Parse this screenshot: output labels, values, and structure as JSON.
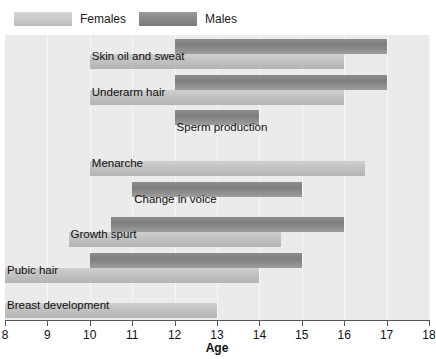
{
  "chart_data": {
    "type": "bar",
    "orientation": "horizontal",
    "title": "",
    "xlabel": "Age",
    "ylabel": "",
    "xlim": [
      8,
      18
    ],
    "xticks": [
      8,
      9,
      10,
      11,
      12,
      13,
      14,
      15,
      16,
      17,
      18
    ],
    "grid": true,
    "legend": {
      "position": "top-left",
      "entries": [
        {
          "name": "Females",
          "color": "#c5c5c5"
        },
        {
          "name": "Males",
          "color": "#858585"
        }
      ]
    },
    "categories": [
      "Skin oil and sweat",
      "Underarm hair",
      "Sperm production",
      "Menarche",
      "Change in voice",
      "Growth spurt",
      "Pubic hair",
      "Breast development"
    ],
    "series": [
      {
        "name": "Males",
        "color": "#858585",
        "ranges": [
          {
            "category": "Skin oil and sweat",
            "start": 12.0,
            "end": 17.0
          },
          {
            "category": "Underarm hair",
            "start": 12.0,
            "end": 17.0
          },
          {
            "category": "Sperm production",
            "start": 12.0,
            "end": 14.0
          },
          {
            "category": "Menarche",
            "start": null,
            "end": null
          },
          {
            "category": "Change in voice",
            "start": 11.0,
            "end": 15.0
          },
          {
            "category": "Growth spurt",
            "start": 10.5,
            "end": 16.0
          },
          {
            "category": "Pubic hair",
            "start": 10.0,
            "end": 15.0
          },
          {
            "category": "Breast development",
            "start": null,
            "end": null
          }
        ]
      },
      {
        "name": "Females",
        "color": "#c5c5c5",
        "ranges": [
          {
            "category": "Skin oil and sweat",
            "start": 10.0,
            "end": 16.0
          },
          {
            "category": "Underarm hair",
            "start": 10.0,
            "end": 16.0
          },
          {
            "category": "Sperm production",
            "start": null,
            "end": null
          },
          {
            "category": "Menarche",
            "start": 10.0,
            "end": 16.5
          },
          {
            "category": "Change in voice",
            "start": null,
            "end": null
          },
          {
            "category": "Growth spurt",
            "start": 9.5,
            "end": 14.5
          },
          {
            "category": "Pubic hair",
            "start": 8.0,
            "end": 14.0
          },
          {
            "category": "Breast development",
            "start": 8.0,
            "end": 13.0
          }
        ]
      }
    ],
    "row_labels": [
      {
        "text": "Skin oil and sweat",
        "age_anchor": 10.0
      },
      {
        "text": "Underarm hair",
        "age_anchor": 10.0
      },
      {
        "text": "Sperm production",
        "age_anchor": 12.0
      },
      {
        "text": "Menarche",
        "age_anchor": 10.0
      },
      {
        "text": "Change in voice",
        "age_anchor": 11.0
      },
      {
        "text": "Growth spurt",
        "age_anchor": 9.5
      },
      {
        "text": "Pubic hair",
        "age_anchor": 8.0
      },
      {
        "text": "Breast development",
        "age_anchor": 8.0
      }
    ]
  }
}
